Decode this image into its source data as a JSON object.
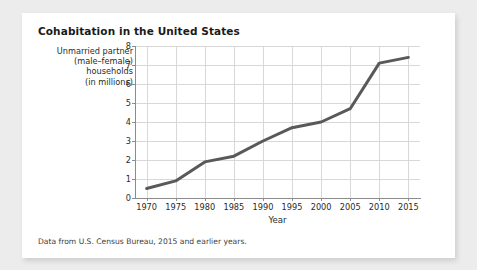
{
  "card": {
    "title": "Cohabitation in the United States",
    "caption": "Data from U.S. Census Bureau, 2015 and earlier years.",
    "background_color": "#ffffff",
    "page_background_color": "#ececed"
  },
  "ylabel_lines": [
    "Unmarried partner",
    "(male–female)",
    "households",
    "(in millions)"
  ],
  "chart_data": {
    "type": "line",
    "title": "Cohabitation in the United States",
    "xlabel": "Year",
    "ylabel": "Unmarried partner (male–female) households (in millions)",
    "x": [
      1970,
      1975,
      1980,
      1985,
      1990,
      1995,
      2000,
      2005,
      2010,
      2015
    ],
    "values": [
      0.5,
      0.9,
      1.9,
      2.2,
      3.0,
      3.7,
      4.0,
      4.7,
      7.1,
      7.4
    ],
    "xtick_labels": [
      "1970",
      "1975",
      "1980",
      "1985",
      "1990",
      "1995",
      "2000",
      "2005",
      "2010",
      "2015"
    ],
    "ytick_labels": [
      "0",
      "1",
      "2",
      "3",
      "4",
      "5",
      "6",
      "7",
      "8"
    ],
    "yticks": [
      0,
      1,
      2,
      3,
      4,
      5,
      6,
      7,
      8
    ],
    "xlim": [
      1968,
      2017
    ],
    "ylim": [
      0,
      8
    ],
    "grid": true,
    "legend": false,
    "line_color": "#595959",
    "line_width": 3,
    "grid_color": "#d8d8d8",
    "axis_color": "#8c8c8c"
  }
}
